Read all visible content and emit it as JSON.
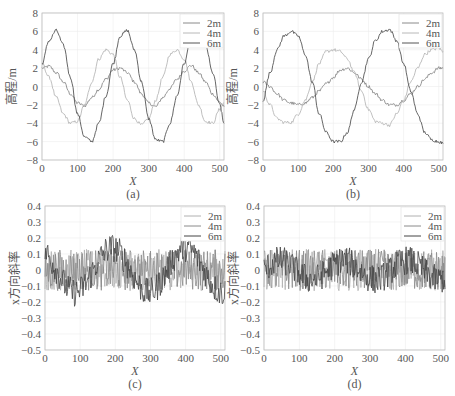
{
  "chart_data": [
    {
      "id": "a",
      "type": "line",
      "caption": "(a)",
      "xlabel": "X",
      "ylabel": "高程/m",
      "xlim": [
        0,
        512
      ],
      "ylim": [
        -8,
        8
      ],
      "xticks": [
        0,
        100,
        200,
        300,
        400,
        500
      ],
      "yticks": [
        -8,
        -6,
        -4,
        -2,
        0,
        2,
        4,
        6,
        8
      ],
      "grid": true,
      "legend": {
        "position": "upper right",
        "entries": [
          "2m",
          "4m",
          "6m"
        ]
      },
      "series": [
        {
          "name": "2m",
          "color": "#8a8a8a",
          "x": [
            0,
            20,
            40,
            60,
            80,
            100,
            120,
            140,
            160,
            180,
            200,
            220,
            240,
            260,
            280,
            300,
            320,
            340,
            360,
            380,
            400,
            420,
            440,
            460,
            480,
            500,
            512
          ],
          "y": [
            2.0,
            2.2,
            1.5,
            0.5,
            -0.8,
            -1.8,
            -2.1,
            -1.2,
            -0.3,
            0.8,
            1.8,
            2.0,
            1.5,
            0.5,
            -0.8,
            -1.8,
            -2.2,
            -1.2,
            -0.2,
            0.8,
            1.7,
            2.3,
            1.5,
            0.5,
            -0.8,
            -1.7,
            -2.2
          ]
        },
        {
          "name": "4m",
          "color": "#b8b8b8",
          "x": [
            0,
            20,
            40,
            60,
            80,
            100,
            120,
            140,
            160,
            180,
            200,
            220,
            240,
            260,
            280,
            300,
            320,
            340,
            360,
            380,
            400,
            420,
            440,
            460,
            480,
            500,
            512
          ],
          "y": [
            2.5,
            1.0,
            -1.2,
            -3.0,
            -4.0,
            -3.8,
            -2.0,
            0.5,
            3.0,
            4.0,
            3.5,
            1.0,
            -1.5,
            -3.5,
            -4.2,
            -3.5,
            -1.5,
            1.0,
            3.5,
            4.0,
            3.0,
            0.5,
            -2.0,
            -3.8,
            -4.0,
            -2.5,
            -1.8
          ]
        },
        {
          "name": "6m",
          "color": "#555555",
          "x": [
            0,
            20,
            40,
            60,
            80,
            100,
            120,
            140,
            160,
            180,
            200,
            220,
            240,
            260,
            280,
            300,
            320,
            340,
            360,
            380,
            400,
            420,
            440,
            460,
            480,
            500,
            512
          ],
          "y": [
            2.5,
            5.0,
            6.1,
            4.5,
            1.0,
            -3.0,
            -5.5,
            -6.0,
            -4.0,
            -1.0,
            2.5,
            5.5,
            6.1,
            4.0,
            0.5,
            -3.5,
            -5.8,
            -6.0,
            -4.0,
            -1.0,
            2.5,
            5.5,
            6.0,
            4.5,
            1.5,
            -2.0,
            -4.0
          ]
        }
      ]
    },
    {
      "id": "b",
      "type": "line",
      "caption": "(b)",
      "xlabel": "X",
      "ylabel": "高程/m",
      "xlim": [
        0,
        512
      ],
      "ylim": [
        -8,
        8
      ],
      "xticks": [
        0,
        100,
        200,
        300,
        400,
        500
      ],
      "yticks": [
        -8,
        -6,
        -4,
        -2,
        0,
        2,
        4,
        6,
        8
      ],
      "grid": true,
      "legend": {
        "position": "upper right",
        "entries": [
          "2m",
          "4m",
          "6m"
        ]
      },
      "series": [
        {
          "name": "2m",
          "color": "#8a8a8a",
          "x": [
            0,
            20,
            40,
            60,
            80,
            100,
            120,
            140,
            160,
            180,
            200,
            220,
            240,
            260,
            280,
            300,
            320,
            340,
            360,
            380,
            400,
            420,
            440,
            460,
            480,
            500,
            512
          ],
          "y": [
            0.5,
            0.0,
            -0.8,
            -1.5,
            -1.8,
            -2.0,
            -1.8,
            -1.2,
            -0.5,
            0.3,
            1.0,
            1.8,
            2.0,
            1.5,
            0.8,
            0.0,
            -0.8,
            -1.5,
            -2.0,
            -2.0,
            -1.5,
            -0.8,
            0.0,
            0.8,
            1.5,
            2.0,
            2.0
          ]
        },
        {
          "name": "4m",
          "color": "#b8b8b8",
          "x": [
            0,
            20,
            40,
            60,
            80,
            100,
            120,
            140,
            160,
            180,
            200,
            220,
            240,
            260,
            280,
            300,
            320,
            340,
            360,
            380,
            400,
            420,
            440,
            460,
            480,
            500,
            512
          ],
          "y": [
            -0.5,
            -2.0,
            -3.5,
            -3.9,
            -3.9,
            -3.0,
            -1.5,
            0.5,
            2.5,
            3.8,
            4.0,
            3.8,
            3.0,
            1.5,
            -0.5,
            -2.5,
            -3.8,
            -4.0,
            -4.2,
            -3.0,
            -1.5,
            0.5,
            2.0,
            3.5,
            4.0,
            4.2,
            3.8
          ]
        },
        {
          "name": "6m",
          "color": "#555555",
          "x": [
            0,
            20,
            40,
            60,
            80,
            100,
            120,
            140,
            160,
            180,
            200,
            220,
            240,
            260,
            280,
            300,
            320,
            340,
            360,
            380,
            400,
            420,
            440,
            460,
            480,
            500,
            512
          ],
          "y": [
            -1.5,
            1.5,
            4.0,
            5.5,
            6.0,
            5.5,
            3.5,
            0.5,
            -3.0,
            -5.0,
            -6.0,
            -6.0,
            -5.0,
            -2.5,
            0.5,
            3.0,
            5.0,
            6.0,
            6.2,
            5.0,
            2.5,
            -0.5,
            -3.0,
            -5.0,
            -5.8,
            -6.0,
            -6.2
          ]
        }
      ]
    },
    {
      "id": "c",
      "type": "line",
      "caption": "(c)",
      "xlabel": "X",
      "ylabel": "x方向斜率",
      "xlim": [
        0,
        512
      ],
      "ylim": [
        -0.5,
        0.4
      ],
      "xticks": [
        0,
        100,
        200,
        300,
        400,
        500
      ],
      "yticks": [
        -0.5,
        -0.4,
        -0.3,
        -0.2,
        -0.1,
        0,
        0.1,
        0.2,
        0.3,
        0.4
      ],
      "grid": true,
      "legend": {
        "position": "upper right",
        "entries": [
          "2m",
          "4m",
          "6m"
        ]
      },
      "noise_amplitude": 0.15,
      "series": [
        {
          "name": "2m",
          "color": "#b0b0b0",
          "trend": "noise around 0"
        },
        {
          "name": "4m",
          "color": "#8a8a8a",
          "trend": "noise around 0"
        },
        {
          "name": "6m",
          "color": "#444444",
          "trend": "sinusoid amplitude ~0.15, period ~210, noise ~0.1"
        }
      ]
    },
    {
      "id": "d",
      "type": "line",
      "caption": "(d)",
      "xlabel": "X",
      "ylabel": "x方向斜率",
      "xlim": [
        0,
        512
      ],
      "ylim": [
        -0.5,
        0.4
      ],
      "xticks": [
        0,
        100,
        200,
        300,
        400,
        500
      ],
      "yticks": [
        -0.5,
        -0.4,
        -0.3,
        -0.2,
        -0.1,
        0,
        0.1,
        0.2,
        0.3,
        0.4
      ],
      "grid": true,
      "legend": {
        "position": "upper right",
        "entries": [
          "2m",
          "4m",
          "6m"
        ]
      },
      "noise_amplitude": 0.15,
      "series": [
        {
          "name": "2m",
          "color": "#b0b0b0",
          "trend": "noise around 0"
        },
        {
          "name": "4m",
          "color": "#8a8a8a",
          "trend": "noise around 0"
        },
        {
          "name": "6m",
          "color": "#444444",
          "trend": "noise around 0, slight low wave"
        }
      ]
    }
  ],
  "panels": [
    {
      "id": "a",
      "box": [
        42,
        13,
        224,
        160
      ]
    },
    {
      "id": "b",
      "box": [
        263,
        13,
        443,
        160
      ]
    },
    {
      "id": "c",
      "box": [
        45,
        206,
        225,
        350
      ]
    },
    {
      "id": "d",
      "box": [
        264,
        206,
        445,
        350
      ]
    }
  ]
}
